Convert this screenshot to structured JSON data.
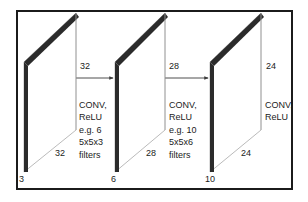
{
  "figure": {
    "colors": {
      "frame": "#1b1b1b",
      "slab_face": "#2b2b2b",
      "outline": "#9a9a9a",
      "text": "#1b1b1b",
      "background": "#ffffff"
    }
  },
  "volumes": [
    {
      "name": "input-volume",
      "depth_label": "3",
      "width_label": "32",
      "height_label": "32"
    },
    {
      "name": "conv1-volume",
      "depth_label": "6",
      "width_label": "28",
      "height_label": "28"
    },
    {
      "name": "conv2-volume",
      "depth_label": "10",
      "width_label": "24",
      "height_label": "24"
    }
  ],
  "operations": [
    {
      "name": "conv1-op",
      "lines": [
        "CONV,",
        "ReLU",
        "e.g. 6",
        "5x5x3",
        "filters"
      ]
    },
    {
      "name": "conv2-op",
      "lines": [
        "CONV,",
        "ReLU",
        "e.g. 10",
        "5x5x6",
        "filters"
      ]
    },
    {
      "name": "conv3-op",
      "lines": [
        "CONV,",
        "ReLU"
      ]
    }
  ],
  "dimension_labels": {
    "v1_top": "32",
    "v1_bottom": "32",
    "v1_depth": "3",
    "v2_top": "28",
    "v2_bottom": "28",
    "v2_depth": "6",
    "v3_top": "24",
    "v3_bottom": "24",
    "v3_depth": "10"
  }
}
